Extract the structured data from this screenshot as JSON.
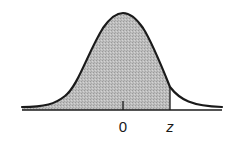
{
  "diagram": {
    "type": "normal-distribution-curve",
    "shaded_region": "area under curve to the left of z",
    "labels": {
      "mean": "0",
      "z": "z"
    },
    "colors": {
      "curve": "#1a1a1a",
      "shade": "#b8b8b8",
      "axis": "#1a1a1a",
      "background": "#ffffff"
    }
  }
}
